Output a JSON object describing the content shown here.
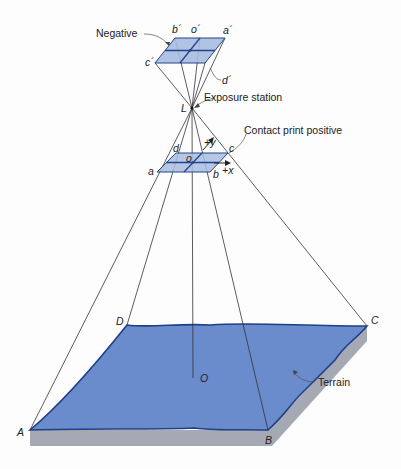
{
  "diagram": {
    "type": "aerial photograph geometry",
    "labels": {
      "negative": "Negative",
      "exposure_station": "Exposure station",
      "contact_print_positive": "Contact print positive",
      "terrain": "Terrain"
    },
    "negative_points": {
      "a": "a´",
      "b": "b´",
      "c": "c´",
      "d": "d´",
      "o": "o´"
    },
    "exposure_point": "L",
    "positive_points": {
      "a": "a",
      "b": "b",
      "c": "c",
      "d": "d",
      "o": "o"
    },
    "axes": {
      "x": "+x",
      "y": "+y"
    },
    "ground_points": {
      "A": "A",
      "B": "B",
      "C": "C",
      "D": "D",
      "O": "O"
    },
    "colors": {
      "plane_fill": "#a9bde0",
      "plane_stroke": "#24448a",
      "terrain_fill": "#6a8bcc",
      "terrain_edge": "#1f3f87",
      "slab": "#a5a9b3",
      "ray": "#333333"
    }
  }
}
